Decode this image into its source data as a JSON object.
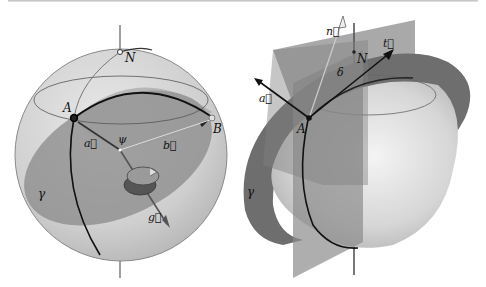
{
  "figure": {
    "left_panel": {
      "labels": {
        "north": "N",
        "point_a": "A",
        "point_b": "B",
        "vector_a": "a⃗",
        "vector_b": "b⃗",
        "vector_g": "g⃗",
        "center": "ψ",
        "plane": "γ"
      }
    },
    "right_panel": {
      "labels": {
        "north": "N",
        "point_a": "A",
        "vector_n": "n⃗",
        "vector_t": "t⃗",
        "vector_a": "a⃗",
        "angle": "δ",
        "plane": "γ"
      }
    }
  },
  "colors": {
    "sphere_light": "#e6e6e6",
    "sphere_mid": "#c2c2c2",
    "plane_dark": "#7a7a7a",
    "plane_mid": "#8e8e8e",
    "ring": "#6a6a6a",
    "ink": "#111111"
  }
}
